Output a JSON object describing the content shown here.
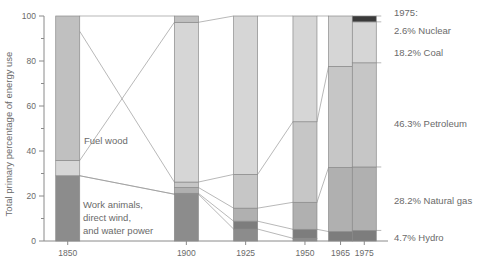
{
  "chart_data": {
    "type": "bar",
    "subtype": "stacked-bar-with-connectors",
    "title": "",
    "xlabel": "",
    "ylabel": "Total primary percentage of energy use",
    "categories": [
      "1850",
      "1900",
      "1925",
      "1950",
      "1965",
      "1975"
    ],
    "x_positions": [
      1850,
      1900,
      1925,
      1950,
      1965,
      1975
    ],
    "ylim": [
      0,
      100
    ],
    "xlim": [
      1840,
      1985
    ],
    "y_ticks": [
      0,
      20,
      40,
      60,
      80,
      100
    ],
    "y_minor_ticks": [
      10,
      30,
      50,
      70,
      90
    ],
    "grid": false,
    "legend": "none",
    "series": [
      {
        "name": "Work animals, direct wind, and water power",
        "key": "work-animals",
        "color": "#8c8c8c",
        "values": [
          29.0,
          20.8,
          5.3,
          1.2,
          0.0,
          0.0
        ]
      },
      {
        "name": "Hydro",
        "key": "hydro",
        "color": "#7d7d7d",
        "values": [
          0.0,
          0.4,
          3.5,
          4.0,
          4.2,
          4.7
        ]
      },
      {
        "name": "Natural gas",
        "key": "natural-gas",
        "color": "#b0b0b0",
        "values": [
          0.0,
          2.6,
          5.8,
          12.0,
          28.5,
          28.2
        ]
      },
      {
        "name": "Petroleum",
        "key": "petroleum",
        "color": "#c6c6c6",
        "values": [
          0.0,
          2.4,
          15.0,
          35.8,
          44.9,
          46.3
        ]
      },
      {
        "name": "Coal",
        "key": "coal",
        "color": "#d6d6d6",
        "values": [
          6.8,
          71.0,
          70.4,
          47.0,
          22.4,
          18.2
        ]
      },
      {
        "name": "Fuel wood",
        "key": "fuel-wood",
        "color": "#c0c0c0",
        "values": [
          64.2,
          2.8,
          0.0,
          0.0,
          0.0,
          0.0
        ]
      },
      {
        "name": "Nuclear",
        "key": "nuclear",
        "color": "#3a3a3a",
        "values": [
          0.0,
          0.0,
          0.0,
          0.0,
          0.0,
          2.6
        ]
      }
    ],
    "stack_boundaries": {
      "note": "cumulative percentage boundaries bottom-to-top per year",
      "1850": [
        0,
        29.0,
        29.0,
        29.0,
        29.0,
        93.2,
        100.0,
        100.0
      ],
      "1900": [
        0,
        20.8,
        21.2,
        23.8,
        26.2,
        97.2,
        100.0,
        100.0
      ],
      "1925": [
        0,
        5.3,
        8.8,
        14.6,
        29.6,
        100.0,
        100.0,
        100.0
      ],
      "1950": [
        0,
        1.2,
        5.2,
        17.2,
        53.0,
        100.0,
        100.0,
        100.0
      ],
      "1965": [
        0,
        0.0,
        4.2,
        32.7,
        77.6,
        100.0,
        100.0,
        100.0
      ],
      "1975": [
        0,
        0.0,
        4.7,
        32.9,
        79.2,
        97.4,
        97.4,
        100.0
      ]
    },
    "annotations": [
      {
        "key": "fuel-wood-annotation",
        "text": "Fuel wood",
        "target_year": 1900
      },
      {
        "key": "work-animals-annotation-line1",
        "text": "Work animals,"
      },
      {
        "key": "work-animals-annotation-line2",
        "text": "direct wind,"
      },
      {
        "key": "work-animals-annotation-line3",
        "text": "and water power"
      }
    ],
    "side_labels": {
      "heading": "1975:",
      "items": [
        {
          "key": "nuclear",
          "text": "2.6% Nuclear",
          "value": 2.6
        },
        {
          "key": "coal",
          "text": "18.2% Coal",
          "value": 18.2
        },
        {
          "key": "petroleum",
          "text": "46.3% Petroleum",
          "value": 46.3
        },
        {
          "key": "natural-gas",
          "text": "28.2% Natural gas",
          "value": 28.2
        },
        {
          "key": "hydro",
          "text": "4.7% Hydro",
          "value": 4.7
        }
      ]
    }
  },
  "axis": {
    "y_title": "Total primary percentage of energy use",
    "y_tick_labels": [
      "0",
      "20",
      "40",
      "60",
      "80",
      "100"
    ],
    "x_tick_labels": [
      "1850",
      "1900",
      "1925",
      "1950",
      "1965",
      "1975"
    ]
  },
  "annotations": {
    "fuel_wood": "Fuel wood",
    "work_animals_1": "Work animals,",
    "work_animals_2": "direct wind,",
    "work_animals_3": "and water power"
  },
  "side": {
    "heading": "1975:",
    "nuclear": "2.6% Nuclear",
    "coal": "18.2% Coal",
    "petroleum": "46.3% Petroleum",
    "natural_gas": "28.2% Natural gas",
    "hydro": "4.7% Hydro"
  },
  "colors": {
    "work_animals": "#8c8c8c",
    "hydro": "#7d7d7d",
    "natural_gas": "#b0b0b0",
    "petroleum": "#c6c6c6",
    "coal": "#d6d6d6",
    "fuel_wood": "#c0c0c0",
    "nuclear": "#3a3a3a",
    "axis": "#8a8a8a",
    "text": "#6a6a6a",
    "connector": "#9a9a9a",
    "bar_outline": "#8a8a8a"
  }
}
